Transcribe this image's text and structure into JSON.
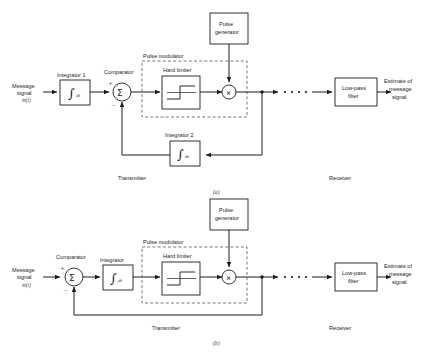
{
  "figure": {
    "caption_a": "(a)",
    "caption_b": "(b)"
  },
  "colors": {
    "line": "#1c1c1c",
    "dashed": "#555555",
    "background": "#ffffff",
    "text": "#1c1c1c"
  },
  "diagram_a": {
    "input": {
      "line1": "Message",
      "line2": "signal",
      "line3": "m(t)"
    },
    "integrator1": {
      "label": "Integrator 1",
      "symbol": "∫",
      "symbol_suffix": "dt"
    },
    "comparator": {
      "label": "Comparator",
      "symbol": "Σ",
      "plus": "+",
      "minus": "−"
    },
    "pulse_modulator": {
      "label": "Pulse modulator"
    },
    "hard_limiter": {
      "label": "Hard limiter"
    },
    "multiplier": {
      "symbol": "×"
    },
    "pulse_generator": {
      "line1": "Pulse",
      "line2": "generator"
    },
    "integrator2": {
      "label": "Integrator 2",
      "symbol": "∫",
      "symbol_suffix": "dt"
    },
    "lowpass_filter": {
      "line1": "Low-pass",
      "line2": "filter"
    },
    "output": {
      "line1": "Estimate of",
      "line2": "message",
      "line3": "signal"
    },
    "transmitter_label": "Transmitter",
    "receiver_label": "Receiver"
  },
  "diagram_b": {
    "input": {
      "line1": "Message",
      "line2": "signal",
      "line3": "m(t)"
    },
    "comparator": {
      "label": "Comparator",
      "symbol": "Σ",
      "plus": "+",
      "minus": "−"
    },
    "integrator": {
      "label": "Integrator",
      "symbol": "∫",
      "symbol_suffix": "dt"
    },
    "pulse_modulator": {
      "label": "Pulse modulator"
    },
    "hard_limiter": {
      "label": "Hard limiter"
    },
    "multiplier": {
      "symbol": "×"
    },
    "pulse_generator": {
      "line1": "Pulse",
      "line2": "generator"
    },
    "lowpass_filter": {
      "line1": "Low-pass",
      "line2": "filter"
    },
    "output": {
      "line1": "Estimate of",
      "line2": "message",
      "line3": "signal"
    },
    "transmitter_label": "Transmitter",
    "receiver_label": "Receiver"
  }
}
